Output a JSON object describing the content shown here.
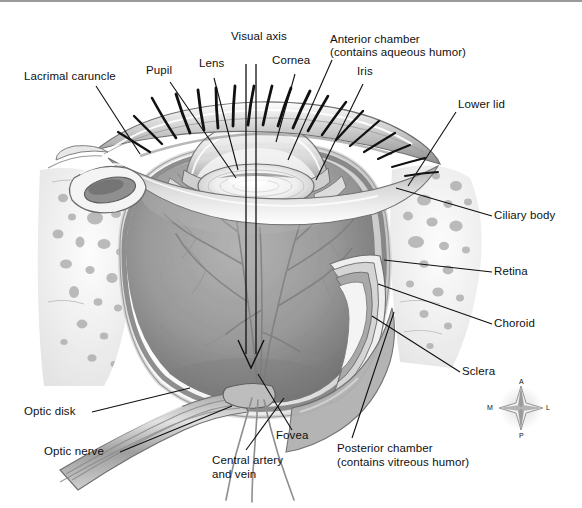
{
  "figure": {
    "background": "#ffffff",
    "border_color": "#9a9a9a",
    "line_color": "#101010",
    "ink": {
      "dark": "#2b2b2b",
      "mid": "#9a9a9a",
      "light": "#d8d8d8",
      "vitreous": "#8e8e8e",
      "sclera": "#f2f2f2"
    }
  },
  "labels": {
    "lacrimal_caruncle": "Lacrimal caruncle",
    "pupil": "Pupil",
    "lens": "Lens",
    "visual_axis": "Visual axis",
    "cornea": "Cornea",
    "iris_top": "Iris",
    "anterior_chamber_l1": "Anterior chamber",
    "anterior_chamber_l2": "(contains aqueous humor)",
    "iris": "Iris",
    "lower_lid": "Lower lid",
    "ciliary_body": "Ciliary body",
    "retina": "Retina",
    "choroid": "Choroid",
    "sclera": "Sclera",
    "optic_disk": "Optic disk",
    "optic_nerve": "Optic nerve",
    "central_artery_l1": "Central artery",
    "central_artery_l2": "and vein",
    "fovea": "Fovea",
    "posterior_chamber_l1": "Posterior chamber",
    "posterior_chamber_l2": "(contains vitreous humor)"
  },
  "compass": {
    "north": "A",
    "south": "P",
    "west": "M",
    "east": "L"
  },
  "structures": [
    {
      "name": "lacrimal-caruncle",
      "label": "Lacrimal caruncle"
    },
    {
      "name": "pupil",
      "label": "Pupil"
    },
    {
      "name": "lens",
      "label": "Lens"
    },
    {
      "name": "visual-axis",
      "label": "Visual axis"
    },
    {
      "name": "cornea",
      "label": "Cornea"
    },
    {
      "name": "anterior-chamber",
      "label": "Anterior chamber (contains aqueous humor)"
    },
    {
      "name": "iris",
      "label": "Iris"
    },
    {
      "name": "lower-lid",
      "label": "Lower lid"
    },
    {
      "name": "ciliary-body",
      "label": "Ciliary body"
    },
    {
      "name": "retina",
      "label": "Retina"
    },
    {
      "name": "choroid",
      "label": "Choroid"
    },
    {
      "name": "sclera",
      "label": "Sclera"
    },
    {
      "name": "optic-disk",
      "label": "Optic disk"
    },
    {
      "name": "optic-nerve",
      "label": "Optic nerve"
    },
    {
      "name": "central-artery-and-vein",
      "label": "Central artery and vein"
    },
    {
      "name": "fovea",
      "label": "Fovea"
    },
    {
      "name": "posterior-chamber",
      "label": "Posterior chamber (contains vitreous humor)"
    }
  ]
}
